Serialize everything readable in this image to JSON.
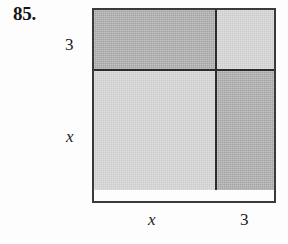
{
  "figure": {
    "problem_number": "85.",
    "type": "area-model-square",
    "background_color": "#fdfdfd",
    "border_color": "#3a3a3a",
    "divider_color": "#2b2b2b",
    "shade_dark": "#a9a9a9",
    "shade_light": "#d2d2d2",
    "dimensions": {
      "top_segment_label": "3",
      "side_upper_label": "3",
      "side_lower_label": "x",
      "bottom_left_label": "x",
      "bottom_right_label": "3"
    },
    "cells": [
      {
        "position": "top-left",
        "shade": "dark",
        "width_label": "x",
        "height_label": "3"
      },
      {
        "position": "top-right",
        "shade": "light",
        "width_label": "3",
        "height_label": "3"
      },
      {
        "position": "bottom-left",
        "shade": "light",
        "width_label": "x",
        "height_label": "x"
      },
      {
        "position": "bottom-right",
        "shade": "dark",
        "width_label": "3",
        "height_label": "x"
      }
    ]
  }
}
